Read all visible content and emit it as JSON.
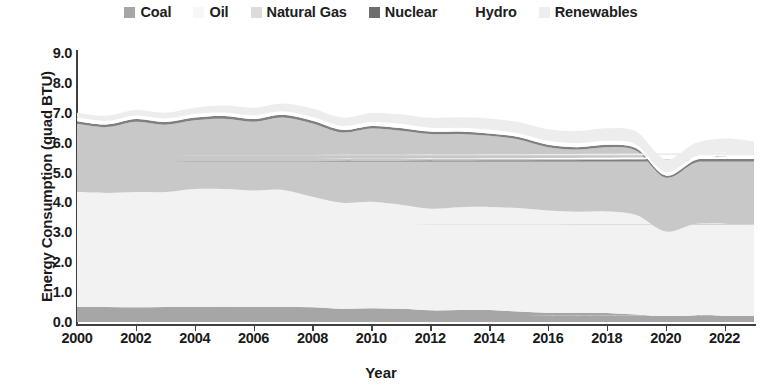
{
  "chart_data": {
    "type": "area",
    "stacked": true,
    "title": "",
    "xlabel": "Year",
    "ylabel": "Energy Consumption (quad BTU)",
    "xlim": [
      2000,
      2023
    ],
    "ylim": [
      0.0,
      9.0
    ],
    "ytick_labels": [
      "9.0",
      "8.0",
      "7.0",
      "6.0",
      "5.0",
      "4.0",
      "3.0",
      "2.0",
      "1.0",
      "0.0"
    ],
    "ytick_values": [
      9.0,
      8.0,
      7.0,
      6.0,
      5.0,
      4.0,
      3.0,
      2.0,
      1.0,
      0.0
    ],
    "xtick_labels": [
      "2000",
      "2002",
      "2004",
      "2006",
      "2008",
      "2010",
      "2012",
      "2014",
      "2016",
      "2018",
      "2020",
      "2022"
    ],
    "xtick_values": [
      2000,
      2002,
      2004,
      2006,
      2008,
      2010,
      2012,
      2014,
      2016,
      2018,
      2020,
      2022
    ],
    "grid": false,
    "legend_position": "top",
    "x": [
      2000,
      2001,
      2002,
      2003,
      2004,
      2005,
      2006,
      2007,
      2008,
      2009,
      2010,
      2011,
      2012,
      2013,
      2014,
      2015,
      2016,
      2017,
      2018,
      2019,
      2020,
      2021,
      2022,
      2023
    ],
    "series": [
      {
        "name": "Coal",
        "color": "#a6a6a6",
        "values": [
          0.5,
          0.5,
          0.49,
          0.5,
          0.5,
          0.51,
          0.5,
          0.5,
          0.49,
          0.44,
          0.46,
          0.44,
          0.39,
          0.4,
          0.4,
          0.35,
          0.31,
          0.31,
          0.3,
          0.25,
          0.2,
          0.23,
          0.22,
          0.2
        ]
      },
      {
        "name": "Oil",
        "color": "#f2f2f2",
        "values": [
          3.85,
          3.82,
          3.86,
          3.85,
          3.95,
          3.94,
          3.9,
          3.92,
          3.7,
          3.55,
          3.56,
          3.48,
          3.4,
          3.44,
          3.45,
          3.46,
          3.42,
          3.38,
          3.4,
          3.33,
          2.83,
          3.05,
          3.08,
          3.05
        ]
      },
      {
        "name": "Natural Gas",
        "color": "#c8c8c8",
        "values": [
          2.28,
          2.2,
          2.35,
          2.25,
          2.3,
          2.35,
          2.3,
          2.42,
          2.45,
          2.35,
          2.45,
          2.48,
          2.5,
          2.45,
          2.38,
          2.3,
          2.12,
          2.08,
          2.15,
          2.15,
          1.8,
          2.05,
          2.18,
          2.12
        ]
      },
      {
        "name": "Nuclear",
        "color": "#808080",
        "values": [
          0.09,
          0.09,
          0.09,
          0.09,
          0.09,
          0.09,
          0.09,
          0.09,
          0.09,
          0.09,
          0.09,
          0.09,
          0.08,
          0.08,
          0.08,
          0.08,
          0.08,
          0.08,
          0.08,
          0.08,
          0.07,
          0.08,
          0.08,
          0.08
        ]
      },
      {
        "name": "Hydro",
        "color": "#ffffff",
        "values": [
          0.12,
          0.12,
          0.12,
          0.12,
          0.12,
          0.12,
          0.13,
          0.12,
          0.13,
          0.13,
          0.13,
          0.14,
          0.13,
          0.13,
          0.13,
          0.12,
          0.13,
          0.13,
          0.13,
          0.13,
          0.12,
          0.13,
          0.13,
          0.13
        ]
      },
      {
        "name": "Renewables",
        "color": "#ededed",
        "values": [
          0.16,
          0.17,
          0.18,
          0.19,
          0.21,
          0.23,
          0.25,
          0.26,
          0.28,
          0.28,
          0.3,
          0.32,
          0.33,
          0.35,
          0.37,
          0.38,
          0.39,
          0.41,
          0.42,
          0.43,
          0.42,
          0.44,
          0.45,
          0.46
        ]
      }
    ],
    "totals": [
      7.0,
      6.9,
      7.09,
      7.0,
      7.17,
      7.24,
      7.17,
      7.31,
      7.14,
      6.84,
      6.99,
      6.95,
      6.83,
      6.85,
      6.81,
      6.69,
      6.45,
      6.39,
      6.48,
      6.37,
      5.44,
      5.98,
      6.14,
      6.04
    ]
  },
  "legend": {
    "items": [
      {
        "label": "Coal",
        "swatch": "legend-swatch-coal",
        "color": "#a6a6a6"
      },
      {
        "label": "Oil",
        "swatch": "legend-swatch-oil",
        "color": "#f7f7f7"
      },
      {
        "label": "Natural Gas",
        "swatch": "legend-swatch-natural-gas",
        "color": "#dcdcdc"
      },
      {
        "label": "Nuclear",
        "swatch": "legend-swatch-nuclear",
        "color": "#6e6e6e"
      },
      {
        "label": "Hydro",
        "swatch": "legend-swatch-hydro",
        "color": "#ffffff"
      },
      {
        "label": "Renewables",
        "swatch": "legend-swatch-renewables",
        "color": "#eeeeee"
      }
    ]
  },
  "axes": {
    "y_title": "Energy Consumption (quad BTU)",
    "x_title": "Year"
  }
}
